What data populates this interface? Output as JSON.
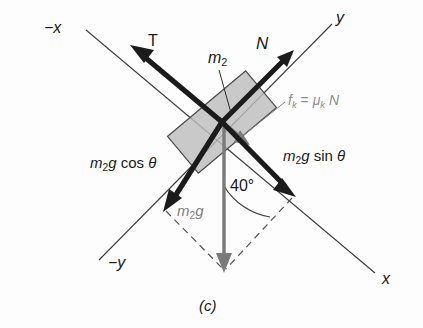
{
  "figure": {
    "caption": "(c)",
    "background_color": "#fdfdfd"
  },
  "axes": {
    "origin": {
      "x": 222,
      "y": 122
    },
    "tilt_degrees": 40,
    "labels": {
      "negative_x": "−x",
      "positive_x": "x",
      "negative_y": "−y",
      "positive_y": "y"
    },
    "line_color": "#3d3d3d"
  },
  "block": {
    "label": "m",
    "label_subscript": "2",
    "fill_color": "#bdbdbd",
    "stroke_color": "#4a4a4a",
    "rotation_degrees": -40
  },
  "vectors": [
    {
      "name": "tension",
      "label": "T",
      "direction": "up-left along negative x axis",
      "color": "#1b1b1b"
    },
    {
      "name": "normal-force",
      "label": "N",
      "direction": "up-right along positive y axis",
      "color": "#1b1b1b"
    },
    {
      "name": "gravity-component-parallel",
      "label_main": "m",
      "label_sub": "2",
      "label_rest": "g",
      "label_func": "cos",
      "label_angle": "θ",
      "direction": "down-left along negative y axis",
      "color": "#1b1b1b"
    },
    {
      "name": "gravity-component-perpendicular",
      "label_main": "m",
      "label_sub": "2",
      "label_rest": "g",
      "label_func": "sin",
      "label_angle": "θ",
      "direction": "down-right along positive x axis",
      "color": "#1b1b1b"
    },
    {
      "name": "weight",
      "label_main": "m",
      "label_sub": "2",
      "label_rest": "g",
      "direction": "straight down",
      "color": "#7a7a7a"
    },
    {
      "name": "kinetic-friction",
      "equation": "f_k = μ_k N",
      "parts": {
        "f": "f",
        "sub1": "k",
        "equals": "=",
        "mu": "μ",
        "sub2": "k",
        "N": "N"
      },
      "direction": "down-right along positive x axis, inside block",
      "color": "#8d8d8d"
    }
  ],
  "angle": {
    "value": "40",
    "unit": "°",
    "display": "40°",
    "between": "weight vector and positive x axis"
  },
  "construction_lines": {
    "style": "dashed",
    "description": "parallelogram guides from weight arrow tip to the two component arrow tips",
    "color": "#555555"
  }
}
